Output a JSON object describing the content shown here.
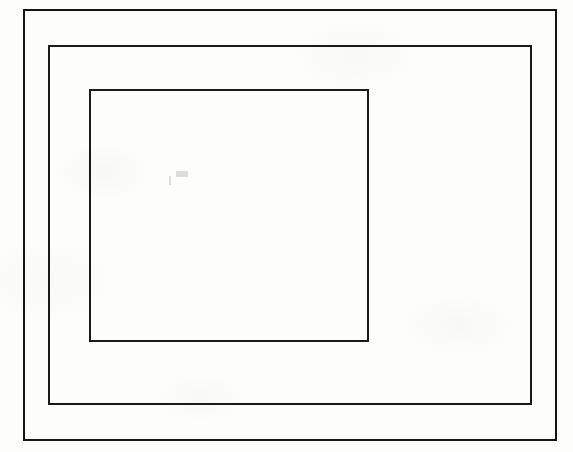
{
  "figure": {
    "canvas": {
      "width": 573,
      "height": 452
    },
    "background_color": "#fdfdfc",
    "stroke_color": "#1a1a1a",
    "shape_count": "3"
  },
  "shapes": [
    {
      "name": "outer-rectangle",
      "label": "Outer rectangle",
      "x": 23,
      "y": 9,
      "width": 534,
      "height": 432,
      "stroke_width": 2,
      "stroke_color": "#141414",
      "fill": "none"
    },
    {
      "name": "middle-rectangle",
      "label": "Middle rectangle",
      "x": 48,
      "y": 45,
      "width": 484,
      "height": 360,
      "stroke_width": 2,
      "stroke_color": "#1a1a1a",
      "fill": "none"
    },
    {
      "name": "inner-rectangle",
      "label": "Inner rectangle",
      "x": 89,
      "y": 89,
      "width": 280,
      "height": 253,
      "stroke_width": 2,
      "stroke_color": "#1a1a1a",
      "fill": "none"
    }
  ],
  "marks": [
    {
      "name": "scan-speck-1",
      "x": 176,
      "y": 171,
      "width": 12,
      "height": 6
    },
    {
      "name": "scan-speck-2",
      "x": 169,
      "y": 176,
      "width": 2,
      "height": 9
    }
  ]
}
